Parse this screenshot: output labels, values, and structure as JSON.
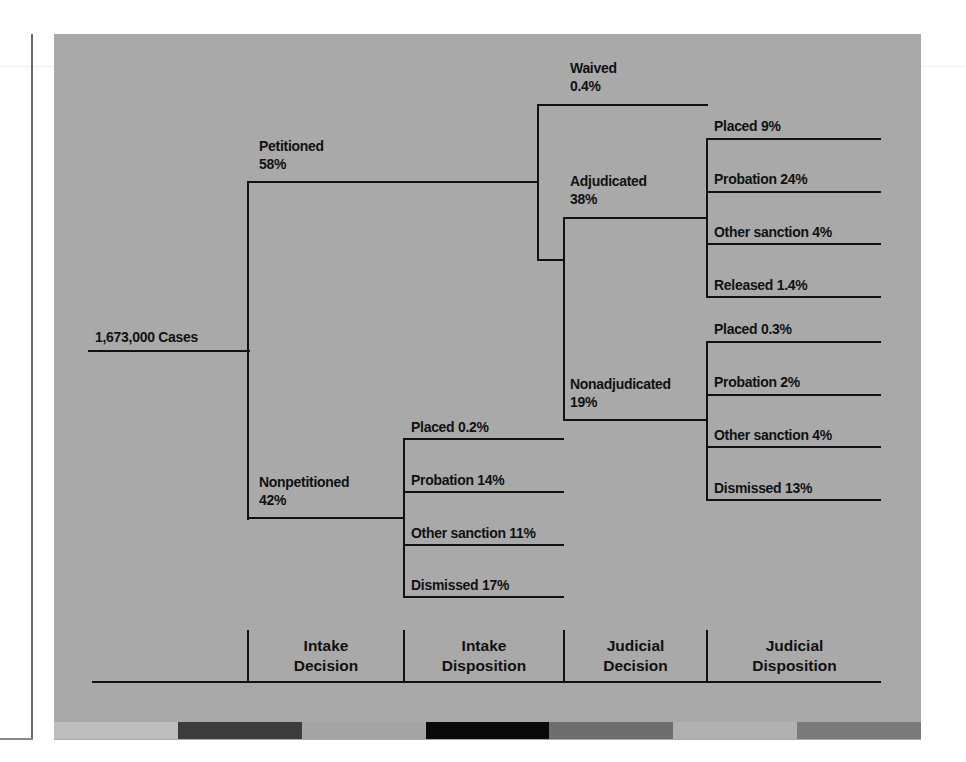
{
  "colors": {
    "panel": "#a9a9a9",
    "line": "#111111",
    "colorbar": [
      "#bdbdbd",
      "#3c3c3c",
      "#a4a4a4",
      "#0a0a0a",
      "#6e6e6e",
      "#b0b0b0",
      "#7a7a7a"
    ]
  },
  "root": {
    "label": "1,673,000 Cases"
  },
  "intake_decision": {
    "petitioned": {
      "label": "Petitioned",
      "pct": "58%"
    },
    "nonpetitioned": {
      "label": "Nonpetitioned",
      "pct": "42%"
    }
  },
  "intake_disposition": [
    {
      "label": "Placed 0.2%"
    },
    {
      "label": "Probation 14%"
    },
    {
      "label": "Other sanction 11%"
    },
    {
      "label": "Dismissed 17%"
    }
  ],
  "judicial_decision": {
    "waived": {
      "label": "Waived",
      "pct": "0.4%"
    },
    "adjudicated": {
      "label": "Adjudicated",
      "pct": "38%"
    },
    "nonadjudicated": {
      "label": "Nonadjudicated",
      "pct": "19%"
    }
  },
  "adjudicated_disposition": [
    {
      "label": "Placed 9%"
    },
    {
      "label": "Probation 24%"
    },
    {
      "label": "Other sanction 4%"
    },
    {
      "label": "Released 1.4%"
    }
  ],
  "nonadjudicated_disposition": [
    {
      "label": "Placed 0.3%"
    },
    {
      "label": "Probation 2%"
    },
    {
      "label": "Other sanction 4%"
    },
    {
      "label": "Dismissed 13%"
    }
  ],
  "stages": [
    {
      "line1": "Intake",
      "line2": "Decision"
    },
    {
      "line1": "Intake",
      "line2": "Disposition"
    },
    {
      "line1": "Judicial",
      "line2": "Decision"
    },
    {
      "line1": "Judicial",
      "line2": "Disposition"
    }
  ]
}
